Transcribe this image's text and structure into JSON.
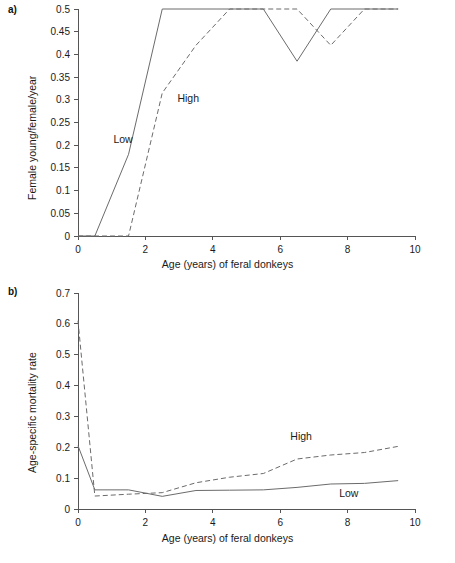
{
  "figure": {
    "panels": [
      {
        "marker": "a)",
        "ylabel": "Female young/female/year",
        "xlabel": "Age (years) of feral donkeys"
      },
      {
        "marker": "b)",
        "ylabel": "Age-specific mortality rate",
        "xlabel": "Age (years) of feral donkeys"
      }
    ]
  },
  "chart_data": [
    {
      "type": "line",
      "title": "",
      "panel": "a)",
      "xlabel": "Age (years) of feral donkeys",
      "ylabel": "Female young/female/year",
      "xlim": [
        0,
        10
      ],
      "ylim": [
        0,
        0.5
      ],
      "xticks": [
        0,
        2,
        4,
        6,
        8,
        10
      ],
      "yticks": [
        0,
        0.05,
        0.1,
        0.15,
        0.2,
        0.25,
        0.3,
        0.35,
        0.4,
        0.45,
        0.5
      ],
      "xtick_labels": [
        "0",
        "2",
        "4",
        "6",
        "8",
        "10"
      ],
      "ytick_labels": [
        "0",
        "0.05",
        "0.1",
        "0.15",
        "0.2",
        "0.25",
        "0.3",
        "0.35",
        "0.4",
        "0.45",
        "0.5"
      ],
      "grid": false,
      "legend_position": "inline-annotations",
      "series": [
        {
          "name": "Low",
          "style": "solid",
          "color": "#6b6b6b",
          "label_x": 1.05,
          "label_y": 0.205,
          "x": [
            0.0,
            0.5,
            1.5,
            2.5,
            5.5,
            6.5,
            7.5,
            9.5
          ],
          "y": [
            0.0,
            0.0,
            0.18,
            0.5,
            0.5,
            0.385,
            0.5,
            0.5
          ]
        },
        {
          "name": "High",
          "style": "dashed",
          "color": "#6b6b6b",
          "label_x": 2.95,
          "label_y": 0.295,
          "x": [
            0.0,
            1.5,
            2.5,
            3.5,
            4.5,
            6.5,
            7.5,
            8.5,
            9.5
          ],
          "y": [
            0.0,
            0.0,
            0.315,
            0.42,
            0.5,
            0.5,
            0.42,
            0.5,
            0.5
          ]
        }
      ]
    },
    {
      "type": "line",
      "title": "",
      "panel": "b)",
      "xlabel": "Age (years) of feral donkeys",
      "ylabel": "Age-specific mortality rate",
      "xlim": [
        0,
        10
      ],
      "ylim": [
        0,
        0.7
      ],
      "xticks": [
        0,
        2,
        4,
        6,
        8,
        10
      ],
      "yticks": [
        0,
        0.1,
        0.2,
        0.3,
        0.4,
        0.5,
        0.6,
        0.7
      ],
      "xtick_labels": [
        "0",
        "2",
        "4",
        "6",
        "8",
        "10"
      ],
      "ytick_labels": [
        "0",
        "0.1",
        "0.2",
        "0.3",
        "0.4",
        "0.5",
        "0.6",
        "0.7"
      ],
      "grid": false,
      "legend_position": "inline-annotations",
      "series": [
        {
          "name": "Low",
          "style": "solid",
          "color": "#6b6b6b",
          "label_x": 7.75,
          "label_y": 0.038,
          "x": [
            0.0,
            0.5,
            1.5,
            2.5,
            3.5,
            4.5,
            5.5,
            6.5,
            7.5,
            8.5,
            9.5
          ],
          "y": [
            0.205,
            0.062,
            0.062,
            0.041,
            0.06,
            0.061,
            0.062,
            0.07,
            0.081,
            0.083,
            0.092
          ]
        },
        {
          "name": "High",
          "style": "dashed",
          "color": "#6b6b6b",
          "label_x": 6.3,
          "label_y": 0.225,
          "x": [
            0.0,
            0.5,
            1.5,
            2.5,
            3.5,
            4.5,
            5.5,
            6.5,
            7.5,
            8.5,
            9.5
          ],
          "y": [
            0.61,
            0.042,
            0.048,
            0.053,
            0.085,
            0.103,
            0.115,
            0.162,
            0.175,
            0.183,
            0.203
          ]
        }
      ]
    }
  ]
}
